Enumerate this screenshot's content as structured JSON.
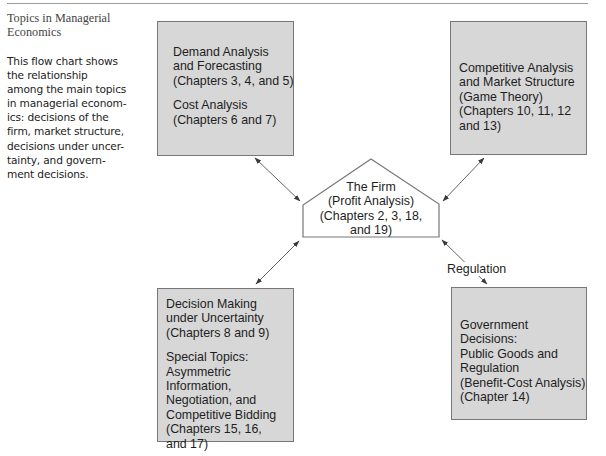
{
  "caption": {
    "title_lines": [
      "Topics in Managerial",
      "Economics"
    ],
    "body_lines": [
      "This flow chart shows",
      "the relationship",
      "among the main topics",
      "in managerial econom-",
      "ics: decisions of the",
      "firm, market structure,",
      "decisions under uncer-",
      "tainty, and govern-",
      "ment decisions."
    ]
  },
  "diagram": {
    "center": {
      "name": "The Firm",
      "lines": [
        "The Firm",
        "(Profit Analysis)",
        "(Chapters 2, 3, 18,",
        "and 19)"
      ]
    },
    "boxes": {
      "top_left": {
        "groups": [
          [
            "Demand Analysis",
            "and Forecasting",
            "(Chapters 3, 4, and 5)"
          ],
          [
            "Cost Analysis",
            "(Chapters 6 and 7)"
          ]
        ]
      },
      "top_right": {
        "groups": [
          [
            "Competitive Analysis",
            "and Market Structure",
            "(Game Theory)",
            "(Chapters 10, 11, 12",
            "and 13)"
          ]
        ]
      },
      "bottom_left": {
        "groups": [
          [
            "Decision Making",
            "under Uncertainty",
            "(Chapters 8 and 9)"
          ],
          [
            "Special Topics:",
            "Asymmetric",
            "Information,",
            "Negotiation, and",
            "Competitive Bidding",
            "(Chapters 15, 16,",
            "and 17)"
          ]
        ]
      },
      "bottom_right": {
        "groups": [
          [
            "Government",
            "Decisions:",
            "Public Goods and",
            "Regulation",
            "(Benefit-Cost Analysis)",
            "(Chapter 14)"
          ]
        ]
      }
    },
    "edges": [
      {
        "from": "top_left",
        "to": "center",
        "label": "",
        "direction": "both"
      },
      {
        "from": "top_right",
        "to": "center",
        "label": "",
        "direction": "both"
      },
      {
        "from": "bottom_left",
        "to": "center",
        "label": "",
        "direction": "both"
      },
      {
        "from": "bottom_right",
        "to": "center",
        "label": "Regulation",
        "direction": "both"
      }
    ],
    "colors": {
      "box_fill": "#d7d7d7",
      "box_border": "#777777",
      "arrow": "#555555",
      "text": "#1e1e1e"
    }
  }
}
